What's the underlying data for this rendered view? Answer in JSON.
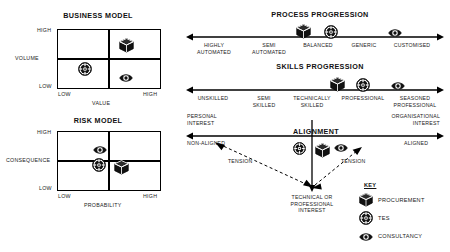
{
  "diagram": {
    "business_model": {
      "title": "BUSINESS MODEL",
      "y_axis_label": "VOLUME",
      "x_axis_label": "VALUE",
      "y_high": "HIGH",
      "y_low": "LOW",
      "x_low": "LOW",
      "x_high": "HIGH",
      "markers": [
        {
          "icon": "cube-icon",
          "entity": "PROCUREMENT",
          "quadrant": "high-volume-high-value"
        },
        {
          "icon": "target-icon",
          "entity": "TES",
          "quadrant": "low-volume-low-value"
        },
        {
          "icon": "eye-icon",
          "entity": "CONSULTANCY",
          "quadrant": "low-volume-high-value"
        }
      ]
    },
    "risk_model": {
      "title": "RISK MODEL",
      "y_axis_label": "CONSEQUENCE",
      "x_axis_label": "PROBABILITY",
      "y_high": "HIGH",
      "y_low": "LOW",
      "x_low": "LOW",
      "x_high": "HIGH",
      "markers": [
        {
          "icon": "eye-icon",
          "entity": "CONSULTANCY",
          "quadrant": "mid-consequence-low-probability"
        },
        {
          "icon": "target-icon",
          "entity": "TES",
          "quadrant": "low-consequence-low-probability"
        },
        {
          "icon": "cube-icon",
          "entity": "PROCUREMENT",
          "quadrant": "low-consequence-low-probability-right"
        }
      ]
    },
    "process_progression": {
      "title": "PROCESS PROGRESSION",
      "scale": [
        "HIGHLY\nAUTOMATED",
        "SEMI\nAUTOMATED",
        "BALANCED",
        "GENERIC",
        "CUSTOMISED"
      ],
      "scale_lines": [
        [
          "HIGHLY",
          "AUTOMATED"
        ],
        [
          "SEMI",
          "AUTOMATED"
        ],
        [
          "BALANCED"
        ],
        [
          "GENERIC"
        ],
        [
          "CUSTOMISED"
        ]
      ],
      "markers": [
        {
          "icon": "cube-icon",
          "entity": "PROCUREMENT",
          "position": "BALANCED"
        },
        {
          "icon": "target-icon",
          "entity": "TES",
          "position": "BALANCED"
        },
        {
          "icon": "eye-icon",
          "entity": "CONSULTANCY",
          "position": "CUSTOMISED"
        }
      ]
    },
    "skills_progression": {
      "title": "SKILLS PROGRESSION",
      "scale_lines": [
        [
          "UNSKILLED"
        ],
        [
          "SEMI",
          "SKILLED"
        ],
        [
          "TECHNICALLY",
          "SKILLED"
        ],
        [
          "PROFESSIONAL"
        ],
        [
          "SEASONED",
          "PROFESSIONAL"
        ]
      ],
      "markers": [
        {
          "icon": "cube-icon",
          "entity": "PROCUREMENT",
          "position": "PROFESSIONAL"
        },
        {
          "icon": "target-icon",
          "entity": "TES",
          "position": "PROFESSIONAL"
        },
        {
          "icon": "eye-icon",
          "entity": "CONSULTANCY",
          "position": "SEASONED PROFESSIONAL"
        }
      ]
    },
    "alignment": {
      "title": "ALIGNMENT",
      "left_top_lines": [
        "PERSONAL",
        "INTEREST"
      ],
      "right_top_lines": [
        "ORGANISATIONAL",
        "INTEREST"
      ],
      "left_below": "NON-ALIGNED",
      "right_below": "ALIGNED",
      "bottom_lines": [
        "TECHNICAL OR",
        "PROFESSIONAL",
        "INTEREST"
      ],
      "tension_left": "TENSION",
      "tension_right": "TENSION",
      "markers": [
        {
          "icon": "target-icon",
          "entity": "TES"
        },
        {
          "icon": "cube-icon",
          "entity": "PROCUREMENT"
        },
        {
          "icon": "eye-icon",
          "entity": "CONSULTANCY"
        }
      ]
    },
    "key": {
      "title": "KEY",
      "items": [
        {
          "icon": "cube-icon",
          "label": "PROCUREMENT"
        },
        {
          "icon": "target-icon",
          "label": "TES"
        },
        {
          "icon": "eye-icon",
          "label": "CONSULTANCY"
        }
      ]
    },
    "colors": {
      "ink": "#111111",
      "line": "#000000",
      "background": "#ffffff"
    }
  }
}
